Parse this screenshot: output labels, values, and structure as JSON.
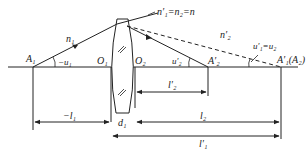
{
  "diagram": {
    "type": "thick lens ray optics",
    "colors": {
      "line": "#222222",
      "background": "#ffffff"
    },
    "labels": {
      "A1": "A₁",
      "n1": "n₁",
      "minus_u1": "−u₁",
      "O1": "O₁",
      "O2": "O₂",
      "index_eq": "n′₁=n₂=n",
      "n2p": "n′₂",
      "u2p": "u′₂",
      "A2p": "A′₂",
      "u1p_eq": "u′₁=u₂",
      "A1p_A2": "A′₁(A₂)",
      "l2p": "l′₂",
      "minus_l1": "−l₁",
      "d1": "d₁",
      "l2": "l₂",
      "l1p": "l′₁"
    }
  }
}
